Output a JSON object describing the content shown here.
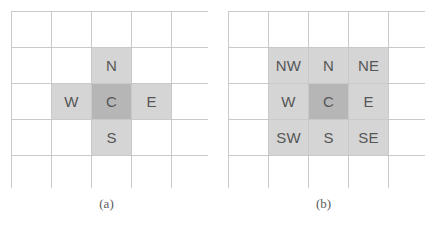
{
  "figure": {
    "panels": [
      {
        "id": "a",
        "caption": "(a)",
        "grid": {
          "rows": 5,
          "cols": 5,
          "cells": [
            [
              {
                "label": "",
                "shade": "none"
              },
              {
                "label": "",
                "shade": "none"
              },
              {
                "label": "",
                "shade": "none"
              },
              {
                "label": "",
                "shade": "none"
              },
              {
                "label": "",
                "shade": "none"
              }
            ],
            [
              {
                "label": "",
                "shade": "none"
              },
              {
                "label": "",
                "shade": "none"
              },
              {
                "label": "N",
                "shade": "light"
              },
              {
                "label": "",
                "shade": "none"
              },
              {
                "label": "",
                "shade": "none"
              }
            ],
            [
              {
                "label": "",
                "shade": "none"
              },
              {
                "label": "W",
                "shade": "light"
              },
              {
                "label": "C",
                "shade": "dark"
              },
              {
                "label": "E",
                "shade": "light"
              },
              {
                "label": "",
                "shade": "none"
              }
            ],
            [
              {
                "label": "",
                "shade": "none"
              },
              {
                "label": "",
                "shade": "none"
              },
              {
                "label": "S",
                "shade": "light"
              },
              {
                "label": "",
                "shade": "none"
              },
              {
                "label": "",
                "shade": "none"
              }
            ],
            [
              {
                "label": "",
                "shade": "none"
              },
              {
                "label": "",
                "shade": "none"
              },
              {
                "label": "",
                "shade": "none"
              },
              {
                "label": "",
                "shade": "none"
              },
              {
                "label": "",
                "shade": "none"
              }
            ]
          ]
        }
      },
      {
        "id": "b",
        "caption": "(b)",
        "grid": {
          "rows": 5,
          "cols": 5,
          "cells": [
            [
              {
                "label": "",
                "shade": "none"
              },
              {
                "label": "",
                "shade": "none"
              },
              {
                "label": "",
                "shade": "none"
              },
              {
                "label": "",
                "shade": "none"
              },
              {
                "label": "",
                "shade": "none"
              }
            ],
            [
              {
                "label": "",
                "shade": "none"
              },
              {
                "label": "NW",
                "shade": "light"
              },
              {
                "label": "N",
                "shade": "light"
              },
              {
                "label": "NE",
                "shade": "light"
              },
              {
                "label": "",
                "shade": "none"
              }
            ],
            [
              {
                "label": "",
                "shade": "none"
              },
              {
                "label": "W",
                "shade": "light"
              },
              {
                "label": "C",
                "shade": "dark"
              },
              {
                "label": "E",
                "shade": "light"
              },
              {
                "label": "",
                "shade": "none"
              }
            ],
            [
              {
                "label": "",
                "shade": "none"
              },
              {
                "label": "SW",
                "shade": "light"
              },
              {
                "label": "S",
                "shade": "light"
              },
              {
                "label": "SE",
                "shade": "light"
              },
              {
                "label": "",
                "shade": "none"
              }
            ],
            [
              {
                "label": "",
                "shade": "none"
              },
              {
                "label": "",
                "shade": "none"
              },
              {
                "label": "",
                "shade": "none"
              },
              {
                "label": "",
                "shade": "none"
              },
              {
                "label": "",
                "shade": "none"
              }
            ]
          ]
        }
      }
    ],
    "colors": {
      "background": "#ffffff",
      "grid_line": "#c9c9c9",
      "shade_light": "#d5d5d5",
      "shade_dark": "#b6b6b6",
      "text": "#565656",
      "caption_text": "#5a5a5a"
    }
  }
}
